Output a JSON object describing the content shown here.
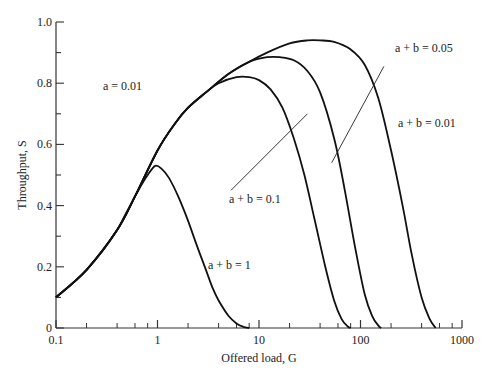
{
  "chart_data": {
    "type": "line",
    "title": "",
    "xlabel": "Offered load, G",
    "ylabel": "Throughput, S",
    "xscale": "log",
    "xlim": [
      0.1,
      1000
    ],
    "ylim": [
      0,
      1.0
    ],
    "x_ticks": [
      "0.1",
      "1",
      "10",
      "100",
      "1000"
    ],
    "y_ticks": [
      "0",
      "0.2",
      "0.4",
      "0.6",
      "0.8",
      "1.0"
    ],
    "grid": false,
    "legend": null,
    "annotations": [
      {
        "text": "a = 0.01",
        "x": 0.2,
        "y": 0.8
      },
      {
        "text": "a + b = 1",
        "x": 3.6,
        "y": 0.2
      },
      {
        "text": "a + b = 0.1",
        "x": 3.2,
        "y": 0.42
      },
      {
        "text": "a + b = 0.05",
        "x": 150,
        "y": 0.9
      },
      {
        "text": "a + b = 0.01",
        "x": 230,
        "y": 0.66
      }
    ],
    "series": [
      {
        "name": "a + b = 1",
        "x": [
          0.1,
          0.15,
          0.2,
          0.3,
          0.4,
          0.5,
          0.6,
          0.7,
          0.8,
          0.95,
          1.1,
          1.3,
          1.6,
          2.0,
          2.5,
          3.0,
          3.5,
          4.0,
          5.0,
          6.0,
          7.0,
          8.0
        ],
        "y": [
          0.1,
          0.15,
          0.19,
          0.26,
          0.32,
          0.38,
          0.43,
          0.47,
          0.5,
          0.53,
          0.52,
          0.49,
          0.43,
          0.35,
          0.26,
          0.19,
          0.13,
          0.09,
          0.04,
          0.015,
          0.004,
          0.0
        ]
      },
      {
        "name": "a + b = 0.1",
        "x": [
          0.1,
          0.2,
          0.4,
          0.6,
          1.0,
          1.5,
          2.0,
          3.0,
          4.0,
          6.0,
          8.0,
          10,
          13,
          17,
          22,
          28,
          35,
          45,
          55,
          65,
          75,
          80
        ],
        "y": [
          0.1,
          0.19,
          0.32,
          0.43,
          0.58,
          0.67,
          0.72,
          0.77,
          0.8,
          0.82,
          0.82,
          0.81,
          0.78,
          0.72,
          0.62,
          0.5,
          0.36,
          0.2,
          0.09,
          0.03,
          0.005,
          0.0
        ]
      },
      {
        "name": "a + b = 0.05",
        "x": [
          0.1,
          0.2,
          0.4,
          0.6,
          1.0,
          1.5,
          2.0,
          3.0,
          5.0,
          8.0,
          12,
          16,
          22,
          30,
          40,
          55,
          70,
          90,
          110,
          130,
          150,
          160
        ],
        "y": [
          0.1,
          0.19,
          0.32,
          0.43,
          0.58,
          0.67,
          0.72,
          0.77,
          0.83,
          0.87,
          0.885,
          0.885,
          0.875,
          0.84,
          0.77,
          0.62,
          0.45,
          0.25,
          0.11,
          0.04,
          0.008,
          0.0
        ]
      },
      {
        "name": "a + b = 0.01",
        "x": [
          0.1,
          0.2,
          0.4,
          0.6,
          1.0,
          1.5,
          2.0,
          3.0,
          5.0,
          8.0,
          12,
          20,
          30,
          40,
          55,
          80,
          110,
          150,
          200,
          260,
          320,
          400,
          480,
          550
        ],
        "y": [
          0.1,
          0.19,
          0.32,
          0.43,
          0.58,
          0.67,
          0.72,
          0.77,
          0.83,
          0.87,
          0.9,
          0.93,
          0.94,
          0.94,
          0.935,
          0.91,
          0.86,
          0.75,
          0.58,
          0.4,
          0.24,
          0.1,
          0.03,
          0.0
        ]
      }
    ],
    "leader_lines": [
      {
        "label": "a + b = 0.05",
        "from": [
          170,
          0.855
        ],
        "to": [
          52,
          0.54
        ]
      },
      {
        "label": "a + b = 0.1",
        "from": [
          5.3,
          0.45
        ],
        "to": [
          30,
          0.7
        ]
      }
    ]
  },
  "axes": {
    "xlabel": "Offered load, G",
    "ylabel": "Throughput, S",
    "x_ticks": [
      "0.1",
      "1",
      "10",
      "100",
      "1000"
    ],
    "y_ticks": [
      "0",
      "0.2",
      "0.4",
      "0.6",
      "0.8",
      "1.0"
    ]
  },
  "labels": {
    "a": "a = 0.01",
    "ab1": "a + b = 1",
    "ab01": "a + b = 0.1",
    "ab005": "a + b = 0.05",
    "ab001": "a + b = 0.01"
  },
  "colors": {
    "curve": "#111111",
    "axis": "#333333"
  }
}
